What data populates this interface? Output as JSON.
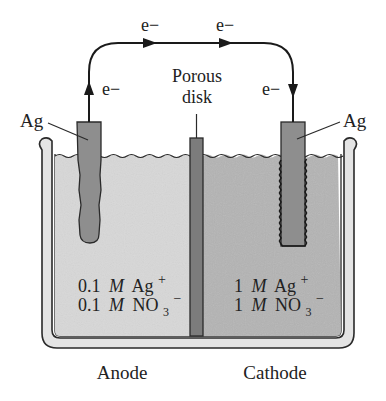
{
  "colors": {
    "anode_solution": "#d8d8d8",
    "cathode_solution": "#b4b4b4",
    "electrode": "#8e8e8e",
    "porous_disk": "#7c7c7c",
    "beaker_wall": "#e4e4e4",
    "outline": "#2a2a2a",
    "text": "#222222"
  },
  "wire": {
    "labels": {
      "left_vertical": "e−",
      "top_left": "e−",
      "top_right": "e−",
      "right_vertical": "e−"
    }
  },
  "electrodes": {
    "left": {
      "label": "Ag"
    },
    "right": {
      "label": "Ag"
    }
  },
  "porous_disk": {
    "label_line1": "Porous",
    "label_line2": "disk"
  },
  "anode": {
    "label": "Anode",
    "solution": {
      "line1": {
        "conc": "0.1",
        "unit": "M",
        "species": "Ag",
        "charge": "+"
      },
      "line2": {
        "conc": "0.1",
        "unit": "M",
        "species": "NO",
        "subscript": "3",
        "charge": "−"
      }
    }
  },
  "cathode": {
    "label": "Cathode",
    "solution": {
      "line1": {
        "conc": "1",
        "unit": "M",
        "species": "Ag",
        "charge": "+"
      },
      "line2": {
        "conc": "1",
        "unit": "M",
        "species": "NO",
        "subscript": "3",
        "charge": "−"
      }
    }
  }
}
